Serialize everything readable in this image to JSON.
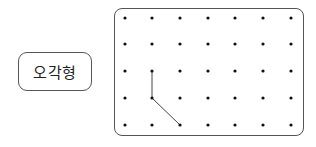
{
  "label": {
    "text": "오각형"
  },
  "geoboard": {
    "columns_x": [
      125,
      152,
      180,
      208,
      235,
      263,
      291
    ],
    "rows_y": [
      18,
      44,
      71,
      98,
      125
    ],
    "segments": [
      {
        "from": [
          1,
          2
        ],
        "to": [
          1,
          3
        ]
      },
      {
        "from": [
          1,
          3
        ],
        "to": [
          2,
          4
        ]
      }
    ],
    "dot_color": "#111111",
    "line_color": "#444444"
  }
}
